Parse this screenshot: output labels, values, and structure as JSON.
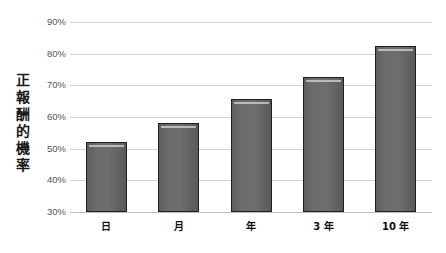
{
  "chart_data": {
    "type": "bar",
    "title": "",
    "subtitle": "",
    "xlabel": "",
    "ylabel": "正報酬的機率",
    "categories": [
      "日",
      "月",
      "年",
      "3 年",
      "10 年"
    ],
    "values": [
      52.0,
      58.0,
      65.7,
      72.7,
      82.3
    ],
    "series": [
      {
        "name": "正報酬的機率",
        "values": [
          52.0,
          58.0,
          65.7,
          72.7,
          82.3
        ]
      }
    ],
    "ylim": [
      30,
      90
    ],
    "ytick_values": [
      30,
      40,
      50,
      60,
      70,
      80,
      90
    ],
    "ytick_labels": [
      "30%",
      "40%",
      "50%",
      "60%",
      "70%",
      "80%",
      "90%"
    ],
    "grid": true,
    "legend": false,
    "legend_position": "none",
    "annotations": [],
    "bar_color": "#6b6b6b",
    "bar_edge_color": "#1f1f1f",
    "grid_color": "#d2d2d2",
    "axis_label_color": "#555555",
    "background_color": "#ffffff"
  }
}
